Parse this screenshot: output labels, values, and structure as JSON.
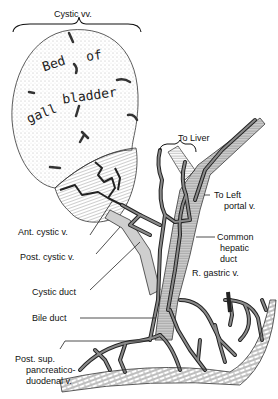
{
  "figure": {
    "gallbladder_text": {
      "line1": [
        "Bed",
        "of"
      ],
      "line2": [
        "gall",
        "bladder"
      ]
    },
    "labels": {
      "cystic_vv": "Cystic vv.",
      "to_liver": "To Liver",
      "to_left_portal_1": "To Left",
      "to_left_portal_2": "portal v.",
      "ant_cystic_v": "Ant. cystic v.",
      "post_cystic_v": "Post. cystic v.",
      "common_hepatic_1": "Common",
      "common_hepatic_2": "hepatic",
      "common_hepatic_3": "duct",
      "r_gastric_v": "R. gastric v.",
      "cystic_duct": "Cystic duct",
      "bile_duct": "Bile duct",
      "pspd_1": "Post. sup.",
      "pspd_2": "pancreatico-",
      "pspd_3": "duodenal v."
    },
    "colors": {
      "vein_fill": "#8a8a8a",
      "vein_outline": "#222222",
      "duct_fill": "#c8c8c8",
      "stipple": "#777777",
      "background": "#ffffff"
    }
  }
}
